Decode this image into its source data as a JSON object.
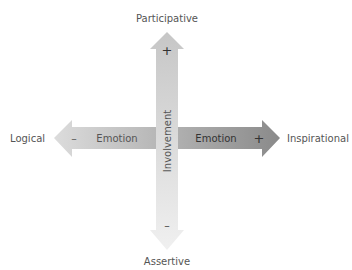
{
  "diagram": {
    "axes": {
      "vertical": {
        "label": "Involvement",
        "top_end": "Participative",
        "bottom_end": "Assertive",
        "top_sign": "+",
        "bottom_sign": "–",
        "colors": {
          "top": "#c4c4c4",
          "bottom": "#ececec"
        }
      },
      "horizontal": {
        "left_label": "Emotion",
        "right_label": "Emotion",
        "left_end": "Logical",
        "right_end": "Inspirational",
        "left_sign": "–",
        "right_sign": "+",
        "colors": {
          "left": "#d8d8d8",
          "right": "#8a8a8a"
        }
      }
    },
    "text_color": "#555555",
    "sign_color": "#333333"
  }
}
